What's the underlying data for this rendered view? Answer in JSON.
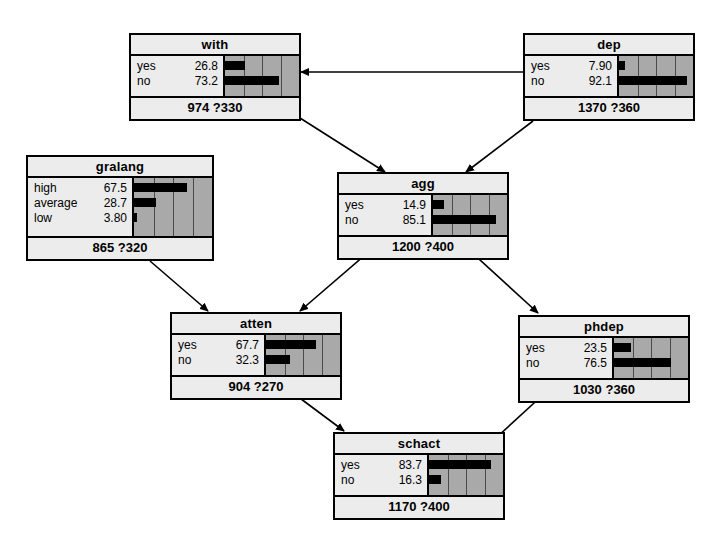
{
  "diagram": {
    "background_color": "#ffffff",
    "node_border_color": "#000000",
    "node_fill_color": "#ececec",
    "bar_panel_color": "#a9a9a9",
    "bar_color": "#000000",
    "edge_color": "#000000"
  },
  "chart_data": {
    "type": "bar",
    "xlabel": "",
    "ylabel": "",
    "xlim": [
      0,
      100
    ],
    "grid": true,
    "gridlines": [
      25,
      50,
      75
    ],
    "legend": "none",
    "nodes": [
      {
        "id": "with",
        "name": "with",
        "footer": "974 ?330",
        "categories": [
          "yes",
          "no"
        ],
        "values": [
          26.8,
          73.2
        ],
        "value_labels": [
          "26.8",
          "73.2"
        ]
      },
      {
        "id": "dep",
        "name": "dep",
        "footer": "1370 ?360",
        "categories": [
          "yes",
          "no"
        ],
        "values": [
          7.9,
          92.1
        ],
        "value_labels": [
          "7.90",
          "92.1"
        ]
      },
      {
        "id": "gralang",
        "name": "gralang",
        "footer": "865 ?320",
        "categories": [
          "high",
          "average",
          "low"
        ],
        "values": [
          67.5,
          28.7,
          3.8
        ],
        "value_labels": [
          "67.5",
          "28.7",
          "3.80"
        ]
      },
      {
        "id": "agg",
        "name": "agg",
        "footer": "1200 ?400",
        "categories": [
          "yes",
          "no"
        ],
        "values": [
          14.9,
          85.1
        ],
        "value_labels": [
          "14.9",
          "85.1"
        ]
      },
      {
        "id": "atten",
        "name": "atten",
        "footer": "904 ?270",
        "categories": [
          "yes",
          "no"
        ],
        "values": [
          67.7,
          32.3
        ],
        "value_labels": [
          "67.7",
          "32.3"
        ]
      },
      {
        "id": "phdep",
        "name": "phdep",
        "footer": "1030 ?360",
        "categories": [
          "yes",
          "no"
        ],
        "values": [
          23.5,
          76.5
        ],
        "value_labels": [
          "23.5",
          "76.5"
        ]
      },
      {
        "id": "schact",
        "name": "schact",
        "footer": "1170 ?400",
        "categories": [
          "yes",
          "no"
        ],
        "values": [
          83.7,
          16.3
        ],
        "value_labels": [
          "83.7",
          "16.3"
        ]
      }
    ],
    "edges": [
      {
        "from": "dep",
        "to": "with"
      },
      {
        "from": "with",
        "to": "agg"
      },
      {
        "from": "dep",
        "to": "agg"
      },
      {
        "from": "gralang",
        "to": "atten"
      },
      {
        "from": "agg",
        "to": "atten"
      },
      {
        "from": "agg",
        "to": "phdep"
      },
      {
        "from": "atten",
        "to": "schact"
      },
      {
        "from": "schact",
        "to": "phdep"
      }
    ]
  }
}
